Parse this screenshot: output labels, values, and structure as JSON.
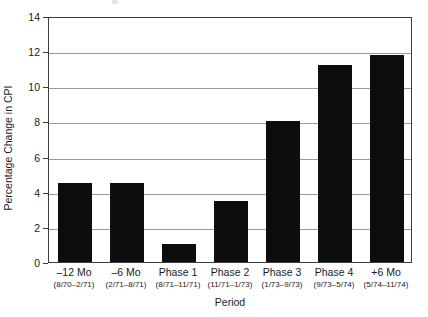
{
  "chart_data": {
    "type": "bar",
    "title": "",
    "xlabel": "Period",
    "ylabel": "Percentage Change in CPI",
    "ylim": [
      0,
      14
    ],
    "ytick_values": [
      0,
      2,
      4,
      6,
      8,
      10,
      12,
      14
    ],
    "ytick_labels": [
      "0",
      "2",
      "4",
      "6",
      "8",
      "10",
      "12",
      "14"
    ],
    "grid": true,
    "legend": "none",
    "bar_color": "#0d0d0d",
    "categories": [
      "‒12 Mo",
      "‒6 Mo",
      "Phase 1",
      "Phase 2",
      "Phase 3",
      "Phase 4",
      "+6 Mo"
    ],
    "category_ranges": [
      "(8/70–2/71)",
      "(2/71–8/71)",
      "(8/71–11/71)",
      "(11/71–1/73)",
      "(1/73–9/73)",
      "(9/73–5/74)",
      "(5/74–11/74)"
    ],
    "values": [
      4.5,
      4.5,
      1.0,
      3.5,
      8.0,
      11.2,
      11.8
    ]
  }
}
